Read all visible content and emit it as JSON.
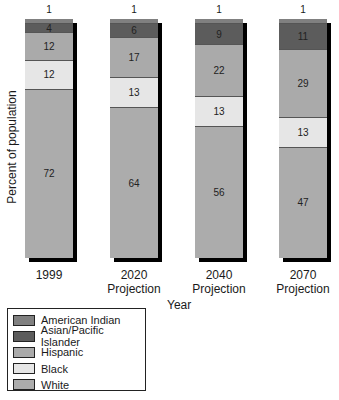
{
  "chart_data": {
    "type": "bar",
    "stacked": true,
    "title": "",
    "xlabel": "Year",
    "ylabel": "Percent of population",
    "ylim": [
      0,
      100
    ],
    "categories": [
      "1999",
      "2020 Projection",
      "2040 Projection",
      "2070 Projection"
    ],
    "category_lines": [
      [
        "1999"
      ],
      [
        "2020",
        "Projection"
      ],
      [
        "2040",
        "Projection"
      ],
      [
        "2070",
        "Projection"
      ]
    ],
    "series": [
      {
        "name": "American Indian",
        "color": "#808080",
        "values": [
          1,
          1,
          1,
          1
        ]
      },
      {
        "name": "Asian/Pacific Islander",
        "color": "#5c5c5c",
        "values": [
          4,
          6,
          9,
          11
        ]
      },
      {
        "name": "Hispanic",
        "color": "#aaaaaa",
        "values": [
          12,
          17,
          22,
          29
        ]
      },
      {
        "name": "Black",
        "color": "#e6e6e6",
        "values": [
          12,
          13,
          13,
          13
        ]
      },
      {
        "name": "White",
        "color": "#acacac",
        "values": [
          72,
          64,
          56,
          47
        ]
      }
    ],
    "legend_position": "bottom-left",
    "grid": false
  },
  "axis": {
    "ylabel": "Percent of population",
    "xlabel": "Year"
  },
  "bars": [
    {
      "top_label": "1",
      "segments": [
        "",
        "4",
        "12",
        "12",
        "72"
      ],
      "x": [
        "1999",
        ""
      ]
    },
    {
      "top_label": "1",
      "segments": [
        "",
        "6",
        "17",
        "13",
        "64"
      ],
      "x": [
        "2020",
        "Projection"
      ]
    },
    {
      "top_label": "1",
      "segments": [
        "",
        "9",
        "22",
        "13",
        "56"
      ],
      "x": [
        "2040",
        "Projection"
      ]
    },
    {
      "top_label": "1",
      "segments": [
        "",
        "11",
        "29",
        "13",
        "47"
      ],
      "x": [
        "2070",
        "Projection"
      ]
    }
  ],
  "legend": [
    {
      "label": "American Indian",
      "color": "#808080"
    },
    {
      "label": "Asian/Pacific Islander",
      "color": "#5c5c5c"
    },
    {
      "label": "Hispanic",
      "color": "#aaaaaa"
    },
    {
      "label": "Black",
      "color": "#e6e6e6"
    },
    {
      "label": "White",
      "color": "#acacac"
    }
  ]
}
